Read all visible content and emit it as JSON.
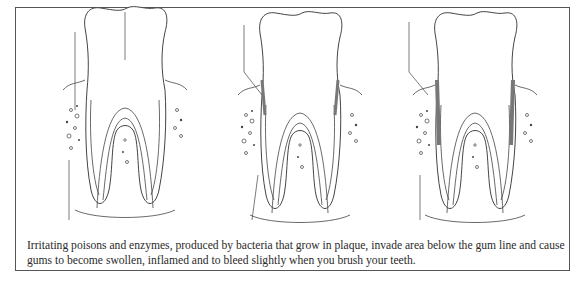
{
  "figure": {
    "panels": [
      {
        "id": "healthy",
        "label": "Healthy tooth"
      },
      {
        "id": "gingivitis",
        "label": "Plaque below gum line"
      },
      {
        "id": "advanced",
        "label": "Swollen, inflamed gums"
      }
    ],
    "caption": "Irritating poisons and enzymes, produced by bacteria that grow in plaque, invade area below the gum line and cause gums to become swollen, inflamed and to bleed slightly when you brush your teeth."
  },
  "colors": {
    "line": "#444444",
    "border": "#555555",
    "plaque": "#777777"
  }
}
